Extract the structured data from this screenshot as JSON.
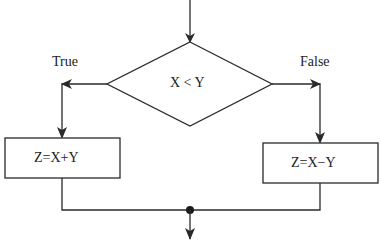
{
  "diagram": {
    "type": "flowchart",
    "stroke_color": "#2a2a2a",
    "text_color": "#222222",
    "background": "#ffffff",
    "decision": {
      "label": "X < Y"
    },
    "branches": {
      "true_label": "True",
      "false_label": "False"
    },
    "process_left": {
      "label": "Z=X+Y"
    },
    "process_right": {
      "label": "Z=X−Y"
    }
  }
}
